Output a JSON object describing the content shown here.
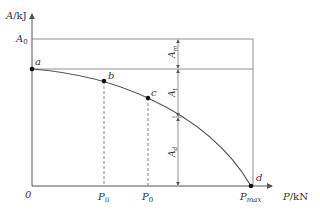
{
  "diagram": {
    "type": "energy-load curve",
    "y_axis": {
      "label_var": "A",
      "label_unit": "/kJ"
    },
    "x_axis": {
      "label_var": "P",
      "label_unit": "/kN",
      "origin": "0"
    },
    "levels": {
      "A0": {
        "main": "A",
        "sub": "0"
      }
    },
    "points": [
      {
        "name": "a"
      },
      {
        "name": "b"
      },
      {
        "name": "c"
      },
      {
        "name": "d"
      }
    ],
    "x_ticks": [
      {
        "main": "P",
        "sub": "II"
      },
      {
        "main": "P",
        "sub": "0"
      },
      {
        "main": "P",
        "sub": "max"
      }
    ],
    "dimensions": [
      {
        "main": "A",
        "sub": "m"
      },
      {
        "main": "A",
        "sub": "t"
      },
      {
        "main": "A",
        "sub": "d"
      }
    ],
    "colors": {
      "line": "#555555",
      "point": "#111111",
      "background": "#ffffff"
    }
  }
}
